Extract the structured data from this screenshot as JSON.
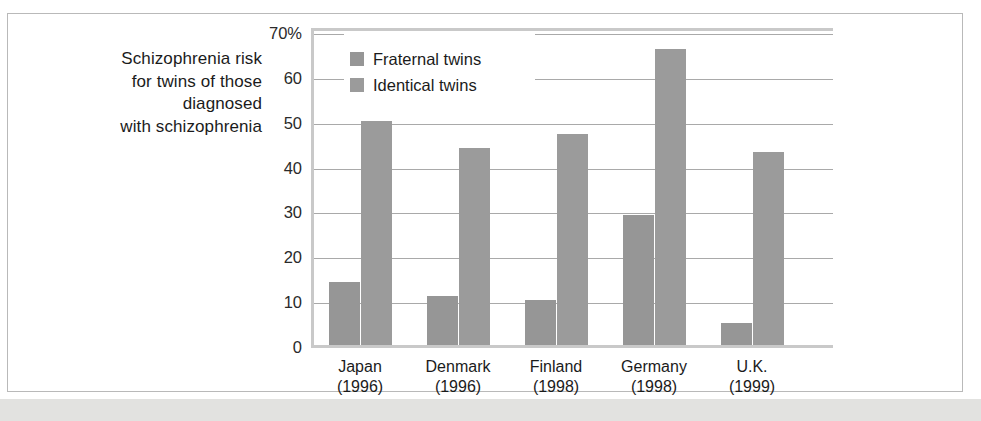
{
  "caption": {
    "lines": [
      "Schizophrenia risk",
      "for twins of those",
      "diagnosed",
      "with schizophrenia"
    ]
  },
  "colors": {
    "fraternal": "#969696",
    "identical": "#9b9b9b",
    "gridline": "#a9a9a9",
    "frame": "#c9c9c9",
    "text": "#1b1b1b",
    "page_band": "#e2e2e0"
  },
  "legend": {
    "position": "inside-top-left",
    "entries": [
      {
        "label": "Fraternal twins",
        "color": "#969696"
      },
      {
        "label": "Identical twins",
        "color": "#9b9b9b"
      }
    ]
  },
  "chart_data": {
    "type": "bar",
    "title": "Schizophrenia risk for twins of those diagnosed with schizophrenia",
    "xlabel": "",
    "ylabel": "",
    "ylim": [
      0,
      70
    ],
    "yticks": [
      0,
      10,
      20,
      30,
      40,
      50,
      60,
      70
    ],
    "ytick_labels": [
      "0",
      "10",
      "20",
      "30",
      "40",
      "50",
      "60",
      "70%"
    ],
    "grid": true,
    "unit": "percent",
    "categories": [
      "Japan",
      "Denmark",
      "Finland",
      "Germany",
      "U.K."
    ],
    "category_years": [
      "(1996)",
      "(1996)",
      "(1998)",
      "(1998)",
      "(1999)"
    ],
    "series": [
      {
        "name": "Fraternal twins",
        "values": [
          14,
          11,
          10,
          29,
          5
        ]
      },
      {
        "name": "Identical twins",
        "values": [
          50,
          44,
          47,
          66,
          43
        ]
      }
    ]
  }
}
